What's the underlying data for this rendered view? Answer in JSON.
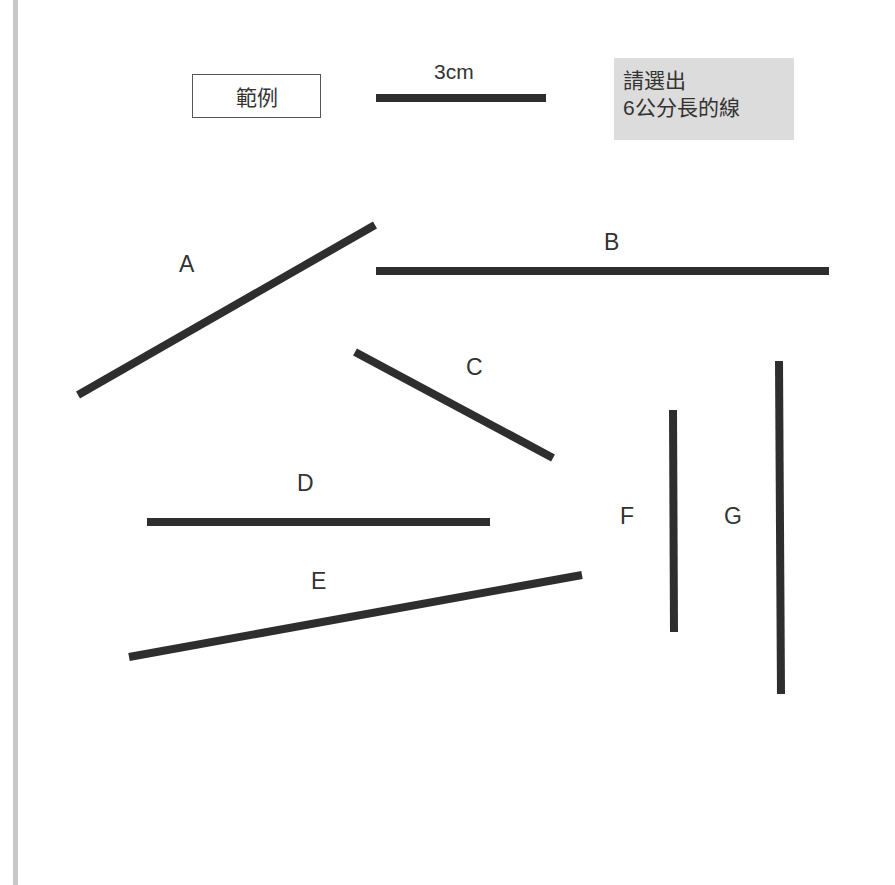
{
  "legend": {
    "box_label": "範例",
    "scale_label": "3cm"
  },
  "instruction": {
    "line1": "請選出",
    "line2": "6公分長的線"
  },
  "colors": {
    "line": "#2e2e2e",
    "instruction_bg": "#dcdcdc",
    "left_bar": "#c8c8c8"
  },
  "lines": [
    {
      "id": "A",
      "label": "A"
    },
    {
      "id": "B",
      "label": "B"
    },
    {
      "id": "C",
      "label": "C"
    },
    {
      "id": "D",
      "label": "D"
    },
    {
      "id": "E",
      "label": "E"
    },
    {
      "id": "F",
      "label": "F"
    },
    {
      "id": "G",
      "label": "G"
    }
  ]
}
